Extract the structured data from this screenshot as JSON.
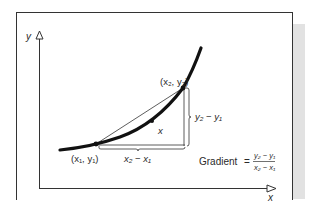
{
  "diagram": {
    "axes": {
      "y_label": "y",
      "x_label": "x"
    },
    "points": {
      "p1": {
        "label": "(x₁, y₁)",
        "x_sub": "1",
        "y_sub": "1"
      },
      "p2": {
        "label": "(x₂, y₂)",
        "x_sub": "2",
        "y_sub": "2"
      },
      "mid": {
        "label": "x"
      }
    },
    "run_label": "x₂ − x₁",
    "rise_label": "y₂ − y₁",
    "formula": {
      "lhs": "Gradient",
      "equals": "=",
      "numerator": "y₂ − y₁",
      "denominator": "x₂ − x₁"
    },
    "colors": {
      "ink": "#1a1a1a",
      "frame": "#333333",
      "shade": "#dcdcdc"
    }
  }
}
